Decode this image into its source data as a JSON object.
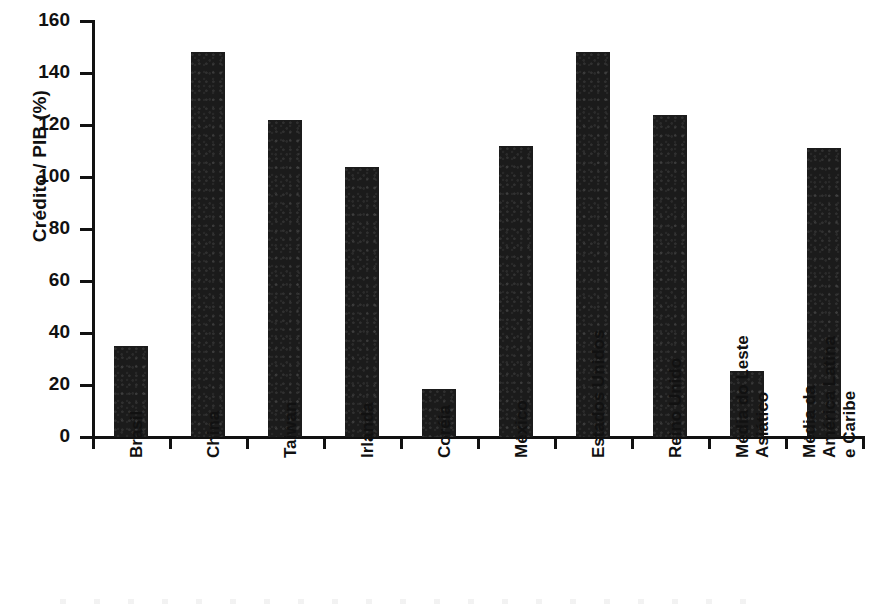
{
  "chart_data": {
    "type": "bar",
    "title": "",
    "xlabel": "",
    "ylabel": "Crédito / PIB (%)",
    "ylim": [
      0,
      160
    ],
    "ytick_step": 20,
    "yticks": [
      0,
      20,
      40,
      60,
      80,
      100,
      120,
      140,
      160
    ],
    "grid": false,
    "legend": null,
    "bar_color": "#1b1b1b",
    "background_color": "#ffffff",
    "axis_color": "#111111",
    "categories": [
      "Brasil",
      "China",
      "Taiwan",
      "Irlanda",
      "Coréia",
      "México",
      "Estados Unidos",
      "Reino Unido",
      "Média do Leste Asiático",
      "Média da América Latina e Caribe"
    ],
    "category_label_lines": [
      [
        "Brasil"
      ],
      [
        "China"
      ],
      [
        "Taiwan"
      ],
      [
        "Irlanda"
      ],
      [
        "Coréia"
      ],
      [
        "México"
      ],
      [
        "Estados Unidos"
      ],
      [
        "Reino Unido"
      ],
      [
        "Média do Leste",
        "Asiático"
      ],
      [
        "Média da",
        "América Latina",
        "e Caribe"
      ]
    ],
    "values": [
      35,
      148,
      122,
      104,
      18.5,
      112,
      148,
      124,
      25.5,
      111
    ]
  }
}
